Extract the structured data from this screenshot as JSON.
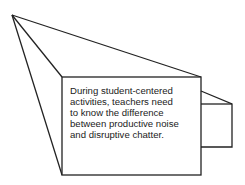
{
  "diagram": {
    "type": "megaphone-illustration",
    "caption": "During student-centered\nactivities, teachers need\nto know the difference\nbetween productive noise\nand disruptive chatter.",
    "stroke_color": "#222222",
    "background_color": "#ffffff"
  }
}
